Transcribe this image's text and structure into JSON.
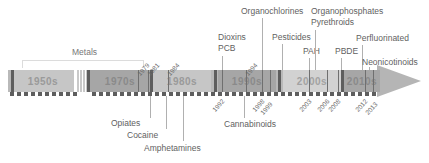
{
  "figure": {
    "type": "timeline",
    "title": "",
    "orientation": "horizontal-left-to-right",
    "arrow_direction": "right"
  },
  "decades": [
    {
      "label": "1950s"
    },
    {
      "label": "1970s"
    },
    {
      "label": "1980s"
    },
    {
      "label": "1990s"
    },
    {
      "label": "2000s"
    },
    {
      "label": "2010s"
    }
  ],
  "years": [
    {
      "value": "1979"
    },
    {
      "value": "1981"
    },
    {
      "value": "1984"
    },
    {
      "value": "1994"
    },
    {
      "value": "1992"
    },
    {
      "value": "1998"
    },
    {
      "value": "1999"
    },
    {
      "value": "2003"
    },
    {
      "value": "2006"
    },
    {
      "value": "2008"
    },
    {
      "value": "2012"
    },
    {
      "value": "2013"
    }
  ],
  "labels_above": [
    {
      "text": "Metals"
    },
    {
      "text": "Dioxins"
    },
    {
      "text": "PCB"
    },
    {
      "text": "Organochlorines"
    },
    {
      "text": "Pesticides"
    },
    {
      "text": "PAH"
    },
    {
      "text": "Organophosphates"
    },
    {
      "text": "Pyrethroids"
    },
    {
      "text": "PBDE"
    },
    {
      "text": "Perfluorinated"
    },
    {
      "text": "Neonicotinoids"
    }
  ],
  "labels_below": [
    {
      "text": "Opiates"
    },
    {
      "text": "Cocaine"
    },
    {
      "text": "Amphetamines"
    },
    {
      "text": "Cannabinoids"
    }
  ],
  "colors": {
    "bar_base": "#b9b9b9",
    "bar_dark": "#a6a6a6",
    "bar_light": "#c6c6c6",
    "tick_dark": "#5e5e5e",
    "text": "#5f5f5f",
    "leader": "#b0b0b0",
    "background": "#ffffff"
  }
}
